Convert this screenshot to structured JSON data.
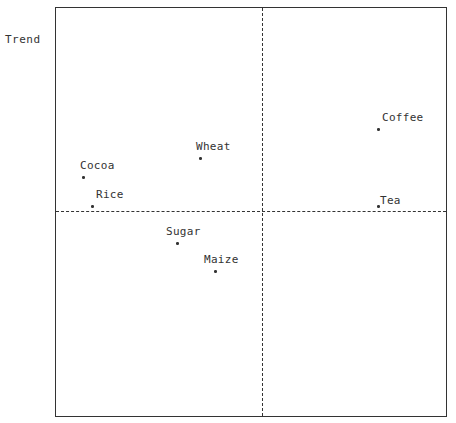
{
  "chart_data": {
    "type": "scatter",
    "title": "",
    "xlabel": "",
    "ylabel": "Trend",
    "grid": false,
    "legend": null,
    "quadrant_dividers": {
      "vertical_x": 0,
      "horizontal_y": 0,
      "style": "dashed"
    },
    "xlim": [
      -1,
      1
    ],
    "ylim": [
      -1,
      1
    ],
    "points": [
      {
        "label": "Cocoa",
        "x": -0.87,
        "y": 0.17
      },
      {
        "label": "Rice",
        "x": -0.82,
        "y": 0.02
      },
      {
        "label": "Wheat",
        "x": -0.3,
        "y": 0.26
      },
      {
        "label": "Sugar",
        "x": -0.41,
        "y": -0.16
      },
      {
        "label": "Maize",
        "x": -0.23,
        "y": -0.29
      },
      {
        "label": "Coffee",
        "x": 0.62,
        "y": 0.41
      },
      {
        "label": "Tea",
        "x": 0.62,
        "y": 0.02
      }
    ]
  },
  "layout": {
    "frame": {
      "left": 55,
      "top": 7,
      "width": 392,
      "height": 410
    },
    "divider_px": {
      "x": 206,
      "y": 203
    },
    "points_px": [
      {
        "label": "Cocoa",
        "x": 27,
        "y": 169,
        "lx": -3,
        "ly": -18
      },
      {
        "label": "Rice",
        "x": 36,
        "y": 198,
        "lx": 4,
        "ly": -18
      },
      {
        "label": "Wheat",
        "x": 144,
        "y": 150,
        "lx": -4,
        "ly": -18
      },
      {
        "label": "Sugar",
        "x": 121,
        "y": 235,
        "lx": -11,
        "ly": -18
      },
      {
        "label": "Maize",
        "x": 159,
        "y": 263,
        "lx": -11,
        "ly": -18
      },
      {
        "label": "Coffee",
        "x": 322,
        "y": 121,
        "lx": 4,
        "ly": -18
      },
      {
        "label": "Tea",
        "x": 322,
        "y": 198,
        "lx": 2,
        "ly": -12
      }
    ]
  }
}
